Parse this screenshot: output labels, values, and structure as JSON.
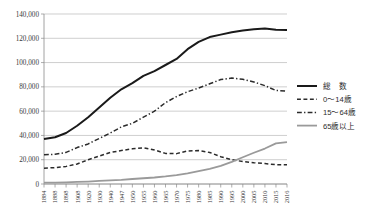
{
  "chart_data": {
    "type": "line",
    "title": "",
    "xlabel": "",
    "ylabel": "",
    "ylim": [
      0,
      140000
    ],
    "ytick_values": [
      0,
      20000,
      40000,
      60000,
      80000,
      100000,
      120000,
      140000
    ],
    "ytick_labels": [
      "0",
      "20,000",
      "40,000",
      "60,000",
      "80,000",
      "100,000",
      "120,000",
      "140,000"
    ],
    "grid": true,
    "legend_position": "right",
    "categories": [
      "1884",
      "1888",
      "1898",
      "1908",
      "1920",
      "1930",
      "1940",
      "1947",
      "1950",
      "1955",
      "1960",
      "1965",
      "1970",
      "1975",
      "1980",
      "1985",
      "1990",
      "1995",
      "2000",
      "2005",
      "2010",
      "2015",
      "2016"
    ],
    "series": [
      {
        "name": "総　数",
        "style": "solid",
        "color": "#1a1a1a",
        "width": 2.0,
        "values": [
          37000,
          38500,
          42000,
          48000,
          55000,
          63000,
          71000,
          78000,
          83000,
          89000,
          93000,
          98000,
          103000,
          111000,
          117000,
          121000,
          123000,
          125000,
          126500,
          127500,
          128000,
          127000,
          126900
        ]
      },
      {
        "name": "0〜14歳",
        "style": "dashed",
        "color": "#2b2b2b",
        "width": 1.5,
        "values": [
          13000,
          13500,
          14500,
          16500,
          20000,
          23000,
          26000,
          27500,
          29000,
          29800,
          28000,
          25200,
          25000,
          27200,
          27500,
          26000,
          22500,
          20000,
          18500,
          17500,
          16800,
          15900,
          15800
        ]
      },
      {
        "name": "15〜64歳",
        "style": "dashdot",
        "color": "#2b2b2b",
        "width": 1.5,
        "values": [
          24000,
          24500,
          26000,
          30000,
          33000,
          37500,
          42000,
          47000,
          50000,
          55000,
          60000,
          67000,
          72000,
          76000,
          79000,
          82500,
          86000,
          87200,
          86200,
          84000,
          81000,
          77000,
          76500
        ]
      },
      {
        "name": "65歳以上",
        "style": "solid",
        "color": "#9a9a9a",
        "width": 1.8,
        "values": [
          1100,
          1200,
          1400,
          1700,
          2000,
          2500,
          3000,
          3400,
          4100,
          4750,
          5350,
          6200,
          7300,
          8800,
          10600,
          12500,
          14900,
          18200,
          22000,
          25700,
          29200,
          33400,
          34500
        ]
      }
    ]
  },
  "legend": {
    "items": [
      {
        "label": "総　数"
      },
      {
        "label": "0〜14歳"
      },
      {
        "label": "15〜64歳"
      },
      {
        "label": "65歳以上"
      }
    ]
  }
}
